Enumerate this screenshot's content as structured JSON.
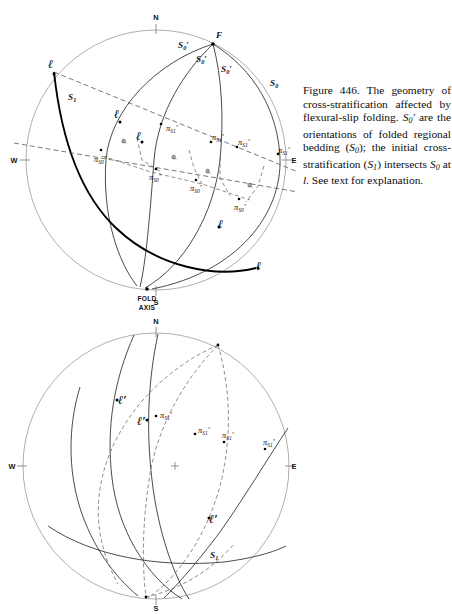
{
  "document": {
    "title": "Figures 446 and 447 — cross-stratification geometry and beta-diagram",
    "page_background": "#ffffff",
    "ink_color": "#111111"
  },
  "figures": [
    {
      "id": "figure-446",
      "number": "Figure 446.",
      "caption_lines": [
        "Figure 446. The geom-",
        "etry of cross-stratifica-",
        "tion affected by flexural-",
        "slip folding. S0' are the",
        "orientations of folded",
        "regional bedding (S0);",
        "the initial cross-stratifi-",
        "cation (S1) intersects S0",
        "at l. See text for ex-",
        "planation."
      ],
      "caption_plain": "Figure 446. The geometry of cross-stratification affected by flexural-slip folding. S0' are the orientations of folded regional bedding (S0); the initial cross-stratification (S1) intersects S0 at l. See text for explanation.",
      "stereonet": {
        "center": [
          150,
          160
        ],
        "radius": 130,
        "compass": {
          "n": "N",
          "s": "S",
          "e": "E",
          "w": "W"
        },
        "pole_label": "F",
        "fold_axis_label_line1": "FOLD",
        "fold_axis_label_line2": "AXIS",
        "plane_labels": [
          {
            "text": "S",
            "sub": "0",
            "prime": true,
            "x": 172,
            "y": 48
          },
          {
            "text": "S",
            "sub": "0",
            "prime": true,
            "x": 190,
            "y": 62
          },
          {
            "text": "S",
            "sub": "0",
            "prime": true,
            "x": 215,
            "y": 70
          },
          {
            "text": "S",
            "sub": "0",
            "prime": false,
            "x": 268,
            "y": 86
          },
          {
            "text": "S",
            "sub": "1",
            "prime": false,
            "x": 66,
            "y": 98
          }
        ],
        "pi_labels": [
          {
            "base": "π",
            "sub": "S1",
            "prime": true,
            "x": 163,
            "y": 128
          },
          {
            "base": "π",
            "sub": "S0",
            "prime": true,
            "x": 98,
            "y": 155
          },
          {
            "base": "π",
            "sub": "S1",
            "prime": true,
            "x": 212,
            "y": 146
          },
          {
            "base": "π",
            "sub": "S1",
            "prime": true,
            "x": 238,
            "y": 150
          },
          {
            "base": "π",
            "sub": "S1",
            "prime": true,
            "x": 278,
            "y": 158
          },
          {
            "base": "π",
            "sub": "S0",
            "prime": true,
            "x": 155,
            "y": 173
          },
          {
            "base": "π",
            "sub": "S0",
            "prime": true,
            "x": 195,
            "y": 184
          },
          {
            "base": "π",
            "sub": "S0",
            "prime": true,
            "x": 238,
            "y": 203
          }
        ],
        "phi_labels": [
          {
            "text": "φ",
            "x": 122,
            "y": 140
          },
          {
            "text": "φ",
            "x": 170,
            "y": 157
          },
          {
            "text": "φ",
            "x": 203,
            "y": 170
          },
          {
            "text": "φ",
            "x": 245,
            "y": 185
          }
        ],
        "l_labels": [
          {
            "text": "l",
            "x": 45,
            "y": 64
          },
          {
            "text": "l",
            "x": 112,
            "y": 118
          },
          {
            "text": "l",
            "x": 132,
            "y": 140
          },
          {
            "text": "l",
            "x": 215,
            "y": 232
          },
          {
            "text": "l",
            "x": 255,
            "y": 272
          }
        ],
        "curve_style_note": "great circles drawn as elliptical arcs on a stereographic primitive"
      }
    },
    {
      "id": "figure-447",
      "number": "Figure 447.",
      "caption_lines": [
        "Figure 447. β-diagram",
        "to illustrate the folded",
        "rocks depicted in Fig-",
        "ure 446. The broken",
        "lines are folded regional",
        "beds (S0'); solid lines are",
        "folded cross-beds (S1')",
        "whose poles are πS1'.",
        "S1 and πS1 refer to the",
        "original cross bed. l' are",
        "intersections of S0' and",
        "S1'."
      ],
      "caption_plain": "Figure 447. β-diagram to illustrate the folded rocks depicted in Figure 446. The broken lines are folded regional beds (S0'); solid lines are folded cross-beds (S1') whose poles are πS1'. S1 and πS1 refer to the original cross bed. l' are intersections of S0' and S1'.",
      "stereonet": {
        "center": [
          150,
          148
        ],
        "radius": 133,
        "compass": {
          "n": "N",
          "s": "S",
          "e": "E",
          "w": "W"
        },
        "plane_labels": [
          {
            "text": "S",
            "sub": "1",
            "prime": false,
            "x": 208,
            "y": 238
          }
        ],
        "pi_labels": [
          {
            "base": "π",
            "sub": "S1",
            "prime": true,
            "x": 160,
            "y": 100
          },
          {
            "base": "π",
            "sub": "S1",
            "prime": true,
            "x": 196,
            "y": 118
          },
          {
            "base": "π",
            "sub": "S1",
            "prime": true,
            "x": 222,
            "y": 122
          },
          {
            "base": "π",
            "sub": "S1",
            "prime": true,
            "x": 262,
            "y": 128
          }
        ],
        "l_labels": [
          {
            "text": "l",
            "x": 118,
            "y": 83
          },
          {
            "text": "l",
            "x": 136,
            "y": 104
          },
          {
            "text": "l",
            "x": 209,
            "y": 203
          }
        ],
        "center_cross": true
      }
    }
  ]
}
